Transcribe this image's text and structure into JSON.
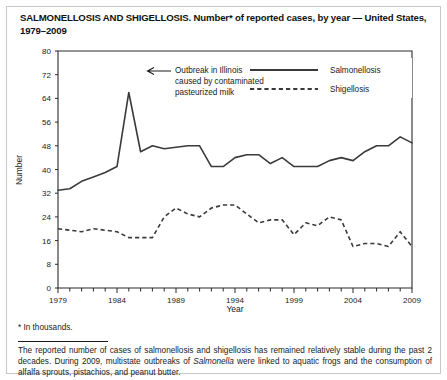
{
  "title": "SALMONELLOSIS AND SHIGELLOSIS. Number* of reported cases, by year — United States, 1979–2009",
  "footnote": "* In thousands.",
  "source_text": "The reported number of cases of salmonellosis and shigellosis has remained relatively stable during the past 2 decades.  During 2009, multistate outbreaks of Salmonella were linked to aquatic frogs and the consumption of alfalfa sprouts, pistachios, and peanut butter.",
  "source_italic_word": "Salmonella",
  "annotation": {
    "line1": "Outbreak in Illinois",
    "line2": "caused by contaminated",
    "line3": "pasteurized milk"
  },
  "legend": {
    "salmonellosis": "Salmonellosis",
    "shigellosis": "Shigellosis"
  },
  "colors": {
    "line": "#3a3a3a",
    "axis": "#2b2b2b",
    "frame": "#c8c8c8",
    "background": "#ffffff"
  },
  "chart_data": {
    "type": "line",
    "title": "SALMONELLOSIS AND SHIGELLOSIS. Number* of reported cases, by year — United States, 1979–2009",
    "xlabel": "Year",
    "ylabel": "Number",
    "xlim": [
      1979,
      2009
    ],
    "ylim": [
      0,
      80
    ],
    "yticks": [
      0,
      8,
      16,
      24,
      32,
      40,
      48,
      56,
      64,
      72,
      80
    ],
    "xticks": [
      1979,
      1984,
      1989,
      1994,
      1999,
      2004,
      2009
    ],
    "xtick_minor_interval": 1,
    "grid": false,
    "legend_position": "top-right",
    "x": [
      1979,
      1980,
      1981,
      1982,
      1983,
      1984,
      1985,
      1986,
      1987,
      1988,
      1989,
      1990,
      1991,
      1992,
      1993,
      1994,
      1995,
      1996,
      1997,
      1998,
      1999,
      2000,
      2001,
      2002,
      2003,
      2004,
      2005,
      2006,
      2007,
      2008,
      2009
    ],
    "series": [
      {
        "name": "Salmonellosis",
        "style": "solid",
        "values": [
          33,
          33.5,
          36,
          37.5,
          39,
          41,
          66,
          46,
          48,
          47,
          47.5,
          48,
          48,
          41,
          41,
          44,
          45,
          45,
          42,
          44,
          41,
          41,
          41,
          43,
          44,
          43,
          46,
          48,
          48,
          51,
          49
        ]
      },
      {
        "name": "Shigellosis",
        "style": "dashed",
        "values": [
          20,
          19.5,
          19,
          20,
          19.5,
          19,
          17,
          17,
          17,
          24,
          27,
          25,
          24,
          27,
          28,
          28,
          25,
          22,
          23,
          23,
          18,
          22,
          21,
          24,
          23,
          14,
          15,
          15,
          14,
          19,
          14
        ]
      }
    ],
    "annotations": [
      {
        "text": "Outbreak in Illinois caused by contaminated pasteurized milk",
        "points_to_year": 1985,
        "points_to_value": 66
      }
    ]
  }
}
